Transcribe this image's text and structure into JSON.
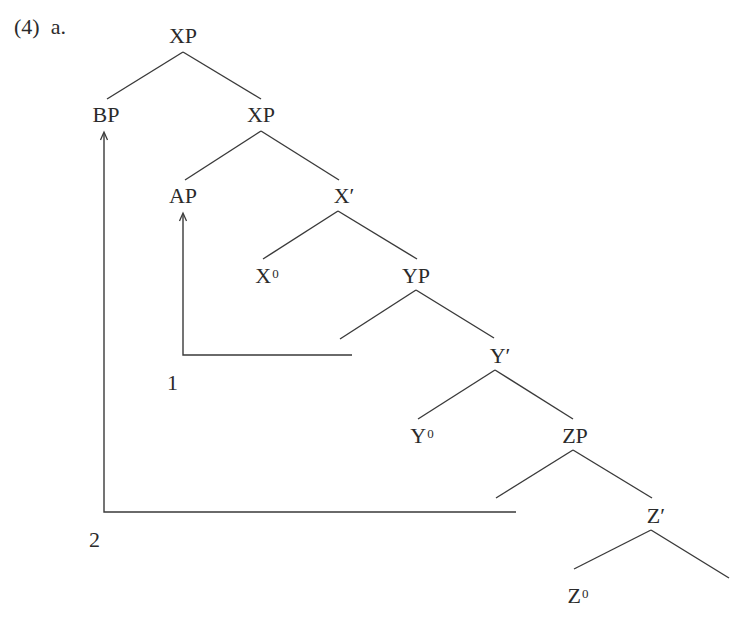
{
  "example": {
    "number": "(4)",
    "sub": "a."
  },
  "top_cut_text": "g                                                 g",
  "tree": {
    "nodes": {
      "root_xp": {
        "label": "XP"
      },
      "bp": {
        "label": "BP"
      },
      "inner_xp": {
        "label": "XP"
      },
      "ap": {
        "label": "AP"
      },
      "x_bar": {
        "label": "X′"
      },
      "x0": {
        "label": "X",
        "sup": "0"
      },
      "yp": {
        "label": "YP"
      },
      "y_bar": {
        "label": "Y′"
      },
      "y0": {
        "label": "Y",
        "sup": "0"
      },
      "zp": {
        "label": "ZP"
      },
      "z_bar": {
        "label": "Z′"
      },
      "z0": {
        "label": "Z",
        "sup": "0"
      }
    },
    "edges": [
      [
        "root_xp",
        "bp"
      ],
      [
        "root_xp",
        "inner_xp"
      ],
      [
        "inner_xp",
        "ap"
      ],
      [
        "inner_xp",
        "x_bar"
      ],
      [
        "x_bar",
        "x0"
      ],
      [
        "x_bar",
        "yp"
      ],
      [
        "yp",
        "empty_spec_y"
      ],
      [
        "yp",
        "y_bar"
      ],
      [
        "y_bar",
        "y0"
      ],
      [
        "y_bar",
        "zp"
      ],
      [
        "zp",
        "empty_spec_z"
      ],
      [
        "zp",
        "z_bar"
      ],
      [
        "z_bar",
        "z0"
      ],
      [
        "z_bar",
        "empty_complement"
      ]
    ],
    "movements": [
      {
        "label": "1",
        "from": "spec_yp",
        "to": "ap"
      },
      {
        "label": "2",
        "from": "spec_zp",
        "to": "bp"
      }
    ]
  },
  "colors": {
    "ink": "#2b2b2b",
    "background": "#ffffff"
  }
}
